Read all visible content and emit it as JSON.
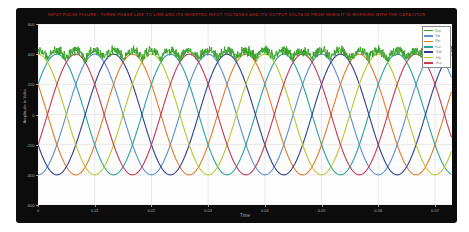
{
  "figure": {
    "title": "INPUT PULSE FIGURE : THREE PHASE LINE TO LINE AND ITS INVERTED INPUT VOLTAGES AND ITS OUTPUT VOLTAGE FROM WHEN IT IS WORKING WITH THE CAPACITOR",
    "xlabel": "Time",
    "ylabel": "Amplitude in Volts",
    "background_color": "#0c0c0c",
    "plot_background_color": "#fdfdfd",
    "grid_color": "#dcdcdc",
    "tick_label_color": "#ababab",
    "title_color": "#8a2020"
  },
  "chart_data": {
    "type": "line",
    "title": "INPUT PULSE FIGURE : THREE PHASE LINE TO LINE AND ITS INVERTED INPUT VOLTAGES AND ITS OUTPUT VOLTAGE FROM WHEN IT IS WORKING WITH THE CAPACITOR",
    "xlabel": "Time",
    "ylabel": "Amplitude in Volts",
    "xlim": [
      0,
      0.073
    ],
    "ylim": [
      -600,
      600
    ],
    "x_ticks": [
      0,
      0.01,
      0.02,
      0.03,
      0.04,
      0.05,
      0.06,
      0.07
    ],
    "x_tick_labels": [
      "0",
      "0.01",
      "0.02",
      "0.03",
      "0.04",
      "0.05",
      "0.06",
      "0.07"
    ],
    "y_ticks": [
      -600,
      -400,
      -200,
      0,
      200,
      400,
      600
    ],
    "y_tick_labels": [
      "-600",
      "-400",
      "-200",
      "0",
      "200",
      "400",
      "600"
    ],
    "grid": true,
    "legend_position": "top-right",
    "frequency_hz": 50,
    "amplitude_v": 400,
    "series": [
      {
        "name": "Vout",
        "color": "#3aa32c",
        "kind": "rectified-output",
        "ripple": {
          "base_offset": -15,
          "noise_amp": 78
        },
        "stroke_width": 1.0
      },
      {
        "name": "Vab",
        "color": "#5b8fd0",
        "kind": "sine",
        "phase_deg": -90,
        "stroke_width": 1.1
      },
      {
        "name": "Vbc",
        "color": "#e07b2a",
        "kind": "sine",
        "phase_deg": -210,
        "stroke_width": 1.1
      },
      {
        "name": "Vca",
        "color": "#2ba39b",
        "kind": "sine",
        "phase_deg": 30,
        "stroke_width": 1.1
      },
      {
        "name": "-Vab",
        "color": "#2e3f8f",
        "kind": "sine",
        "phase_deg": -150,
        "stroke_width": 1.1
      },
      {
        "name": "-Vbc",
        "color": "#b5c92e",
        "kind": "sine",
        "phase_deg": 90,
        "stroke_width": 1.1
      },
      {
        "name": "-Vca",
        "color": "#c23a55",
        "kind": "sine",
        "phase_deg": -30,
        "stroke_width": 1.1
      }
    ]
  },
  "legend": {
    "entries": [
      {
        "label": "Vout",
        "color": "#3aa32c"
      },
      {
        "label": "Vab",
        "color": "#5b8fd0"
      },
      {
        "label": "Vbc",
        "color": "#e07b2a"
      },
      {
        "label": "Vca",
        "color": "#2ba39b"
      },
      {
        "label": "-Vab",
        "color": "#2e3f8f"
      },
      {
        "label": "-Vbc",
        "color": "#b5c92e"
      },
      {
        "label": "-Vca",
        "color": "#c23a55"
      }
    ]
  }
}
